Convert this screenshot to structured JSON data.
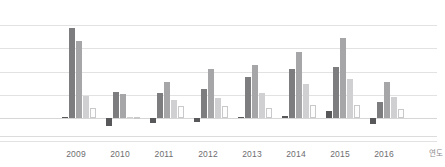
{
  "chart_data": {
    "type": "bar",
    "title": "",
    "subtitle": "",
    "xlabel": "연도",
    "ylabel": "",
    "grid": true,
    "legend": "none",
    "orientation": "vertical",
    "grouping": "grouped",
    "baseline": 0,
    "ylim": [
      -12,
      100
    ],
    "gridline_values": [
      100,
      75,
      50,
      25,
      0,
      -25
    ],
    "categories": [
      "2009",
      "2010",
      "2011",
      "2012",
      "2013",
      "2014",
      "2015",
      "2016"
    ],
    "series": [
      {
        "name": "series-1",
        "color": "#58585a",
        "values": [
          1.5,
          -9.0,
          -5.5,
          -4.0,
          1.0,
          2.5,
          8.0,
          -6.5
        ]
      },
      {
        "name": "series-2",
        "color": "#7d7d7f",
        "values": [
          97.0,
          27.5,
          26.5,
          31.5,
          44.5,
          52.5,
          55.0,
          17.5
        ]
      },
      {
        "name": "series-3",
        "color": "#a6a6a8",
        "values": [
          83.0,
          26.0,
          39.0,
          53.0,
          57.5,
          70.5,
          86.0,
          39.0
        ]
      },
      {
        "name": "series-4",
        "color": "#d0d0d2",
        "values": [
          24.0,
          1.5,
          19.0,
          21.5,
          27.0,
          36.5,
          42.0,
          22.5
        ]
      },
      {
        "name": "series-5",
        "color": "#fdfdfd",
        "values": [
          10.5,
          -1.5,
          13.0,
          13.0,
          11.0,
          13.5,
          14.5,
          9.5
        ]
      }
    ]
  },
  "axis": {
    "x_title": "연도",
    "tick_labels": [
      "2009",
      "2010",
      "2011",
      "2012",
      "2013",
      "2014",
      "2015",
      "2016"
    ]
  }
}
